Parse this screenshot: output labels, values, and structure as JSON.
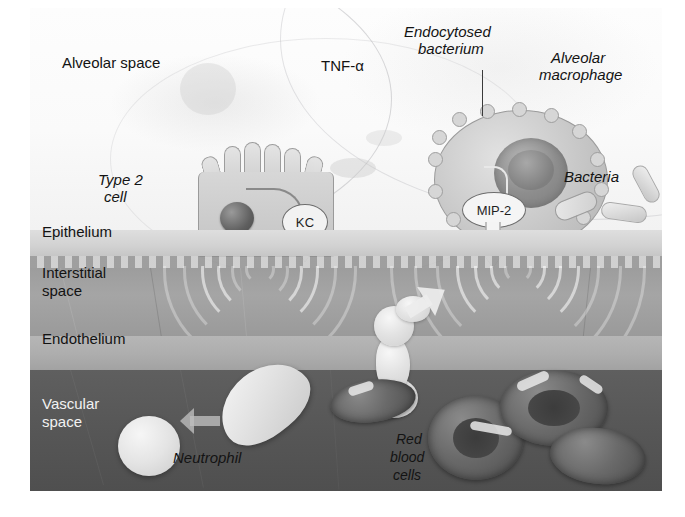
{
  "figure": {
    "width": 685,
    "height": 517,
    "background": "#ffffff"
  },
  "compartments": [
    {
      "id": "alveolar-space",
      "label": "Alveolar space",
      "color": "#fafafa"
    },
    {
      "id": "epithelium",
      "label": "Epithelium",
      "color": "#d4d4d4"
    },
    {
      "id": "interstitial",
      "label": "Interstitial\nspace",
      "color": "#a1a1a1"
    },
    {
      "id": "endothelium",
      "label": "Endothelium",
      "color": "#b0b0b0"
    },
    {
      "id": "vascular",
      "label": "Vascular\nspace",
      "color": "#575757"
    }
  ],
  "labels": {
    "alveolar_space": "Alveolar space",
    "epithelium": "Epithelium",
    "interstitial_space_line1": "Interstitial",
    "interstitial_space_line2": "space",
    "endothelium": "Endothelium",
    "vascular_space_line1": "Vascular",
    "vascular_space_line2": "space",
    "tnf_alpha": "TNF-α",
    "endocytosed_line1": "Endocytosed",
    "endocytosed_line2": "bacterium",
    "alveolar_macrophage_line1": "Alveolar",
    "alveolar_macrophage_line2": "macrophage",
    "type2_cell_line1": "Type 2",
    "type2_cell_line2": "cell",
    "kc": "KC",
    "mip2": "MIP-2",
    "bacteria": "Bacteria",
    "neutrophil": "Neutrophil",
    "red_blood_cells_line1": "Red",
    "red_blood_cells_line2": "blood",
    "red_blood_cells_line3": "cells"
  },
  "mediators": [
    {
      "name": "TNF-α",
      "source": "alveolar space",
      "style": "plain"
    },
    {
      "name": "KC",
      "source": "Type 2 cell",
      "style": "oval-badge"
    },
    {
      "name": "MIP-2",
      "source": "Alveolar macrophage",
      "style": "oval-badge"
    }
  ],
  "cells": [
    {
      "name": "Type 2 cell",
      "compartment": "epithelium"
    },
    {
      "name": "Alveolar macrophage",
      "compartment": "alveolar-space"
    },
    {
      "name": "Endocytosed bacterium",
      "compartment": "alveolar macrophage"
    },
    {
      "name": "Bacteria",
      "compartment": "alveolar-space"
    },
    {
      "name": "Neutrophil",
      "compartment": "vascular-space"
    },
    {
      "name": "Red blood cells",
      "compartment": "vascular-space"
    }
  ],
  "colors": {
    "text": "#131313",
    "alveolar": "#fafafa",
    "epithelium": "#d4d4d4",
    "interstitial": "#a1a1a1",
    "endothelium": "#b0b0b0",
    "vascular": "#575757",
    "badge_fill": "#f3f3f3",
    "badge_stroke": "#6d6d6d"
  }
}
